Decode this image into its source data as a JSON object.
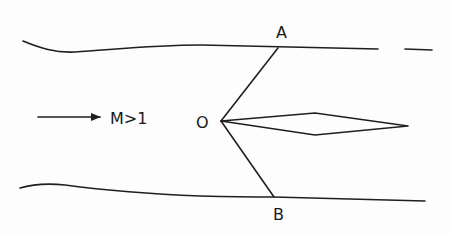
{
  "diagram": {
    "type": "supersonic-flow-wedge-shock",
    "labels": {
      "point_a": "A",
      "point_o": "O",
      "point_b": "B",
      "flow": "M>1"
    },
    "colors": {
      "ink": "#1f1f1f",
      "background": "#fdfdfd"
    }
  }
}
